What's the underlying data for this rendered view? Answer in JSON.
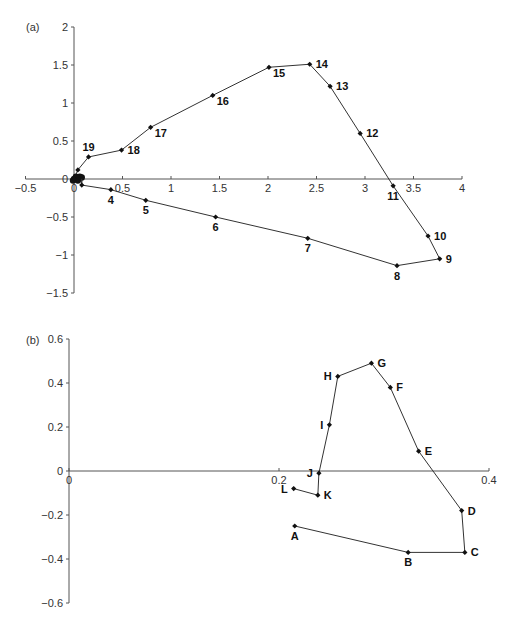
{
  "chart_data": [
    {
      "panel_label": "(a)",
      "type": "line",
      "title": "",
      "xlabel": "",
      "ylabel": "",
      "xlim": [
        -0.5,
        4
      ],
      "ylim": [
        -1.5,
        2
      ],
      "x_ticks": [
        -0.5,
        0,
        0.5,
        1,
        1.5,
        2,
        2.5,
        3,
        3.5,
        4
      ],
      "x_tick_labels": [
        "-0.5",
        "0",
        "0.5",
        "1",
        "1.5",
        "2",
        "2.5",
        "3",
        "3.5",
        "4"
      ],
      "y_ticks": [
        -1.5,
        -1,
        -0.5,
        0,
        0.5,
        1,
        1.5,
        2
      ],
      "y_tick_labels": [
        "-1.5",
        "-1",
        "-0.5",
        "0",
        "0.5",
        "1",
        "1.5",
        "2"
      ],
      "grid": false,
      "legend": null,
      "markers": "diamond",
      "origin_cluster": [
        {
          "x": 0.0,
          "y": 0.0
        },
        {
          "x": 0.02,
          "y": 0.03
        },
        {
          "x": 0.04,
          "y": -0.02
        },
        {
          "x": 0.06,
          "y": 0.03
        },
        {
          "x": 0.08,
          "y": 0.02
        },
        {
          "x": -0.01,
          "y": -0.02
        }
      ],
      "points": [
        {
          "label": "1",
          "x": 0.0,
          "y": 0.0,
          "show_label": false
        },
        {
          "label": "2",
          "x": 0.08,
          "y": 0.03,
          "show_label": false
        },
        {
          "label": "3",
          "x": 0.08,
          "y": -0.08,
          "show_label": false
        },
        {
          "label": "4",
          "x": 0.38,
          "y": -0.14,
          "show_label": true,
          "pos": "below"
        },
        {
          "label": "5",
          "x": 0.74,
          "y": -0.28,
          "show_label": true,
          "pos": "below"
        },
        {
          "label": "6",
          "x": 1.46,
          "y": -0.5,
          "show_label": true,
          "pos": "below"
        },
        {
          "label": "7",
          "x": 2.41,
          "y": -0.78,
          "show_label": true,
          "pos": "below"
        },
        {
          "label": "8",
          "x": 3.33,
          "y": -1.14,
          "show_label": true,
          "pos": "below"
        },
        {
          "label": "9",
          "x": 3.77,
          "y": -1.05,
          "show_label": true,
          "pos": "right"
        },
        {
          "label": "10",
          "x": 3.65,
          "y": -0.75,
          "show_label": true,
          "pos": "right"
        },
        {
          "label": "11",
          "x": 3.29,
          "y": -0.09,
          "show_label": true,
          "pos": "below"
        },
        {
          "label": "12",
          "x": 2.95,
          "y": 0.6,
          "show_label": true,
          "pos": "right"
        },
        {
          "label": "13",
          "x": 2.64,
          "y": 1.22,
          "show_label": true,
          "pos": "right"
        },
        {
          "label": "14",
          "x": 2.43,
          "y": 1.51,
          "show_label": true,
          "pos": "right"
        },
        {
          "label": "15",
          "x": 2.01,
          "y": 1.47,
          "show_label": true,
          "pos": "belowright"
        },
        {
          "label": "16",
          "x": 1.43,
          "y": 1.1,
          "show_label": true,
          "pos": "belowright"
        },
        {
          "label": "17",
          "x": 0.79,
          "y": 0.68,
          "show_label": true,
          "pos": "belowright"
        },
        {
          "label": "18",
          "x": 0.49,
          "y": 0.38,
          "show_label": true,
          "pos": "right"
        },
        {
          "label": "19",
          "x": 0.15,
          "y": 0.29,
          "show_label": true,
          "pos": "above"
        },
        {
          "label": "20",
          "x": 0.04,
          "y": 0.12,
          "show_label": false
        },
        {
          "label": "21",
          "x": 0.0,
          "y": 0.0,
          "show_label": false
        }
      ]
    },
    {
      "panel_label": "(b)",
      "type": "line",
      "title": "",
      "xlabel": "",
      "ylabel": "",
      "xlim": [
        0,
        0.4
      ],
      "ylim": [
        -0.6,
        0.6
      ],
      "x_ticks": [
        0,
        0.2,
        0.4
      ],
      "x_tick_labels": [
        "0",
        "0.2",
        "0.4"
      ],
      "y_ticks": [
        -0.6,
        -0.4,
        -0.2,
        0,
        0.2,
        0.4,
        0.6
      ],
      "y_tick_labels": [
        "-0.6",
        "-0.4",
        "-0.2",
        "0",
        "0.2",
        "0.4",
        "0.6"
      ],
      "grid": false,
      "legend": null,
      "markers": "diamond",
      "points": [
        {
          "label": "A",
          "x": 0.215,
          "y": -0.25,
          "show_label": true,
          "pos": "below"
        },
        {
          "label": "B",
          "x": 0.323,
          "y": -0.37,
          "show_label": true,
          "pos": "below"
        },
        {
          "label": "C",
          "x": 0.377,
          "y": -0.37,
          "show_label": true,
          "pos": "right"
        },
        {
          "label": "D",
          "x": 0.374,
          "y": -0.18,
          "show_label": true,
          "pos": "right"
        },
        {
          "label": "E",
          "x": 0.333,
          "y": 0.09,
          "show_label": true,
          "pos": "right"
        },
        {
          "label": "F",
          "x": 0.306,
          "y": 0.38,
          "show_label": true,
          "pos": "right"
        },
        {
          "label": "G",
          "x": 0.288,
          "y": 0.49,
          "show_label": true,
          "pos": "right"
        },
        {
          "label": "H",
          "x": 0.256,
          "y": 0.43,
          "show_label": true,
          "pos": "left"
        },
        {
          "label": "I",
          "x": 0.248,
          "y": 0.21,
          "show_label": true,
          "pos": "left"
        },
        {
          "label": "J",
          "x": 0.238,
          "y": -0.01,
          "show_label": true,
          "pos": "left"
        },
        {
          "label": "K",
          "x": 0.237,
          "y": -0.11,
          "show_label": true,
          "pos": "right"
        },
        {
          "label": "L",
          "x": 0.214,
          "y": -0.08,
          "show_label": true,
          "pos": "left"
        }
      ]
    }
  ],
  "layout": {
    "panels": [
      {
        "x0px": 74,
        "y0px": 179,
        "xscale": 97,
        "yscale": 76
      },
      {
        "x0px": 69,
        "y0px": 471,
        "xscale": 1050,
        "yscale": 220
      }
    ]
  }
}
